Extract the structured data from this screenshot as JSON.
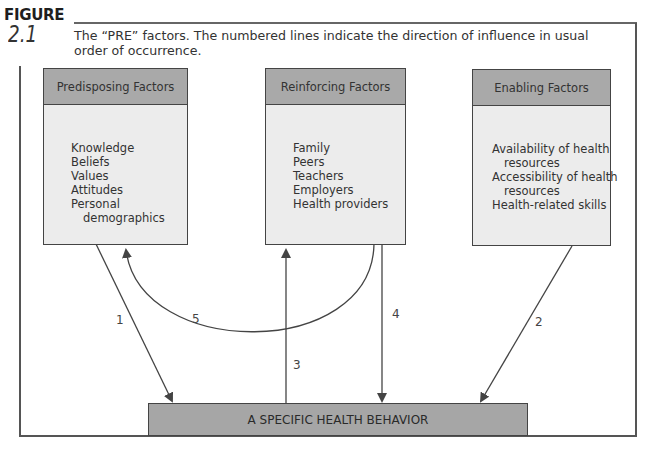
{
  "figure": {
    "label": "FIGURE",
    "number": "2.1",
    "caption": "The “PRE” factors. The numbered lines indicate the direction of influence in usual order of occurrence."
  },
  "boxes": [
    {
      "title": "Predisposing Factors",
      "items": [
        "Knowledge",
        "Beliefs",
        "Values",
        "Attitudes",
        "Personal",
        "demographics"
      ]
    },
    {
      "title": "Reinforcing Factors",
      "items": [
        "Family",
        "Peers",
        "Teachers",
        "Employers",
        "Health providers"
      ]
    },
    {
      "title": "Enabling Factors",
      "items": [
        "Availability of health",
        "resources",
        "Accessibility of health",
        "resources",
        "Health-related skills"
      ]
    }
  ],
  "behavior": {
    "label": "A SPECIFIC HEALTH BEHAVIOR"
  },
  "arrows": [
    {
      "number": "1",
      "from": "Predisposing Factors",
      "to": "A SPECIFIC HEALTH BEHAVIOR"
    },
    {
      "number": "2",
      "from": "Enabling Factors",
      "to": "A SPECIFIC HEALTH BEHAVIOR"
    },
    {
      "number": "3",
      "from": "A SPECIFIC HEALTH BEHAVIOR",
      "to": "Reinforcing Factors"
    },
    {
      "number": "4",
      "from": "Reinforcing Factors",
      "to": "A SPECIFIC HEALTH BEHAVIOR"
    },
    {
      "number": "5",
      "from": "Reinforcing Factors",
      "to": "Predisposing Factors"
    }
  ],
  "colors": {
    "header_fill": "#a9a9a9",
    "body_fill": "#ececec",
    "behavior_fill": "#a6a6a6",
    "line": "#444444"
  }
}
